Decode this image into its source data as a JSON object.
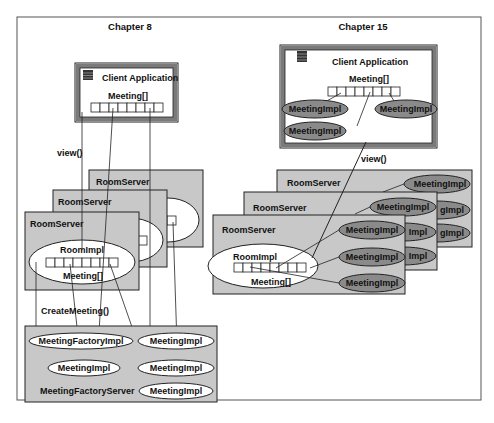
{
  "figure": {
    "left_panel": {
      "title": "Chapter 8",
      "client": {
        "title": "Client Application",
        "array_label": "Meeting[]"
      },
      "call_view": "view()",
      "room_servers": [
        {
          "label": "RoomServer"
        },
        {
          "label": "RoomServer"
        },
        {
          "label": "RoomServer",
          "impl_label": "RoomImpl",
          "array_label": "Meeting[]"
        }
      ],
      "call_create": "CreateMeeting()",
      "factory_server": {
        "label": "MeetingFactoryServer",
        "factory_impl": "MeetingFactoryImpl",
        "meeting_impls": [
          "MeetingImpl",
          "MeetingImpl",
          "MeetingImpl",
          "MeetingImpl"
        ]
      }
    },
    "right_panel": {
      "title": "Chapter 15",
      "client": {
        "title": "Client Application",
        "array_label": "Meeting[]",
        "meeting_impls": [
          "MeetingImpl",
          "MeetingImpl",
          "MeetingImpl"
        ]
      },
      "call_view": "view()",
      "room_servers": [
        {
          "label": "RoomServer",
          "meeting_impls": [
            "MeetingImpl",
            "gImpl",
            "gImpl"
          ]
        },
        {
          "label": "RoomServer",
          "meeting_impls": [
            "MeetingImpl",
            "Impl",
            "Impl"
          ]
        },
        {
          "label": "RoomServer",
          "impl_label": "RoomImpl",
          "array_label": "Meeting[]",
          "meeting_impls": [
            "MeetingImpl",
            "MeetingImpl",
            "MeetingImpl"
          ]
        }
      ]
    },
    "colors": {
      "server_fill": "#c8c8c8",
      "client_border": "#6e6e6e",
      "remote_impl_fill": "#8a8a8a",
      "frame": "#555555"
    }
  }
}
